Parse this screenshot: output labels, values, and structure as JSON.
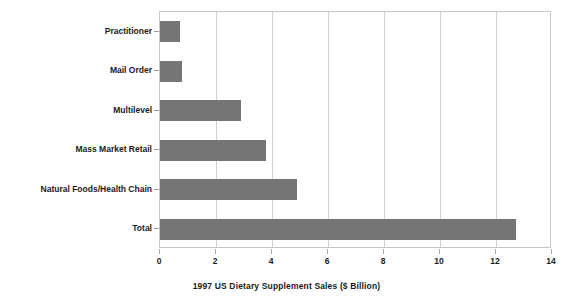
{
  "chart_data": {
    "type": "bar",
    "orientation": "horizontal",
    "title": "",
    "xlabel": "1997 US Dietary Supplement Sales ($ Billion)",
    "ylabel": "",
    "categories": [
      "Practitioner",
      "Mail Order",
      "Multilevel",
      "Mass Market Retail",
      "Natural Foods/Health Chain",
      "Total"
    ],
    "values": [
      0.7,
      0.8,
      2.9,
      3.8,
      4.9,
      12.7
    ],
    "xlim": [
      0,
      14
    ],
    "xticks": [
      0,
      2,
      4,
      6,
      8,
      10,
      12,
      14
    ],
    "xtick_labels": [
      "0",
      "2",
      "4",
      "6",
      "8",
      "10",
      "12",
      "14"
    ],
    "grid": "vertical",
    "legend": "none",
    "bar_color": "#757575",
    "gridline_color": "#d2d2d2",
    "border_color": "#c9c9c9",
    "text_color": "#1a1a1a",
    "background": "#ffffff"
  }
}
